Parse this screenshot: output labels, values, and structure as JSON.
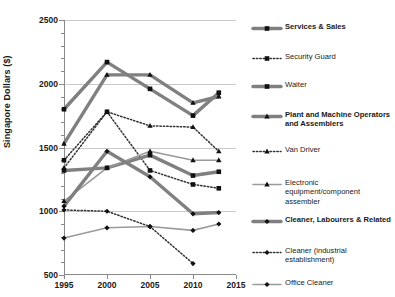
{
  "chart_data": {
    "type": "line",
    "title": "",
    "xlabel": "",
    "ylabel": "Singapore Dollars ($)",
    "x": [
      1995,
      2000,
      2005,
      2010,
      2013
    ],
    "xlim": [
      1995,
      2015
    ],
    "ylim": [
      500,
      2500
    ],
    "xticks": [
      "1995",
      "2000",
      "2005",
      "2010",
      "2015"
    ],
    "yticks": [
      "500",
      "1000",
      "1500",
      "2000",
      "2500"
    ],
    "grid": true,
    "legend_position": "right",
    "series": [
      {
        "name": "Services & Sales",
        "marker": "square",
        "line": "thick-gray",
        "values": [
          1800,
          2170,
          1960,
          1750,
          1930
        ]
      },
      {
        "name": "Security Guard",
        "marker": "square",
        "line": "dotted",
        "values": [
          1400,
          1780,
          1320,
          1210,
          1180
        ]
      },
      {
        "name": "Waiter",
        "marker": "square",
        "line": "thick-gray",
        "values": [
          1320,
          1340,
          1440,
          1280,
          1310
        ]
      },
      {
        "name": "Plant and Machine Operators and Assemblers",
        "marker": "triangle",
        "line": "thick-gray",
        "values": [
          1530,
          2070,
          2070,
          1850,
          1900
        ]
      },
      {
        "name": "Van Driver",
        "marker": "triangle",
        "line": "dotted",
        "values": [
          1340,
          1780,
          1670,
          1660,
          1470
        ]
      },
      {
        "name": "Electronic equipment/component assembler",
        "marker": "triangle",
        "line": "thin-gray",
        "values": [
          1080,
          1340,
          1470,
          1400,
          1400
        ]
      },
      {
        "name": "Cleaner, Labourers & Related",
        "marker": "diamond",
        "line": "thick-gray",
        "values": [
          1040,
          1470,
          1270,
          980,
          990
        ]
      },
      {
        "name": "Cleaner (industrial establishment)",
        "marker": "diamond",
        "line": "dotted",
        "values": [
          1010,
          1000,
          880,
          590,
          null
        ]
      },
      {
        "name": "Office Cleaner",
        "marker": "diamond",
        "line": "thin-gray",
        "values": [
          790,
          870,
          880,
          850,
          900
        ]
      }
    ]
  },
  "legend": {
    "items": [
      {
        "label": "Services & Sales",
        "bold": true,
        "marker": "square",
        "line": "thick-gray"
      },
      {
        "label": "Security Guard",
        "bold": false,
        "marker": "square",
        "line": "dotted"
      },
      {
        "label": "Waiter",
        "bold": false,
        "marker": "square",
        "line": "thick-gray"
      },
      {
        "label": "Plant and Machine Operators and Assemblers",
        "bold": true,
        "marker": "triangle",
        "line": "thick-gray"
      },
      {
        "label": "Van Driver",
        "bold": false,
        "marker": "triangle",
        "line": "dotted"
      },
      {
        "label": "Electronic equipment/component assembler",
        "bold": false,
        "marker": "triangle",
        "line": "thin-gray"
      },
      {
        "label": "Cleaner, Labourers & Related",
        "bold": true,
        "marker": "diamond",
        "line": "thick-gray"
      },
      {
        "label": "Cleaner (industrial establishment)",
        "bold": false,
        "marker": "diamond",
        "line": "dotted"
      },
      {
        "label": "Office Cleaner",
        "bold": false,
        "marker": "diamond",
        "line": "thin-gray"
      }
    ]
  },
  "colors": {
    "thick_gray": "#808080",
    "thin_gray": "#9a9a9a",
    "marker": "#111111",
    "dotted": "#333333",
    "gridline": "#c9c9c9",
    "axis": "#8a8a8a"
  }
}
